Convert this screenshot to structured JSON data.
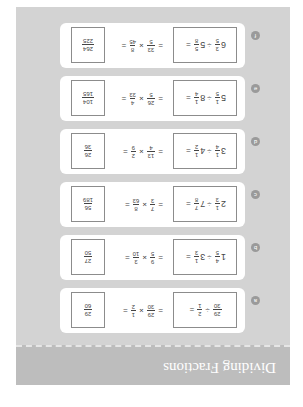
{
  "header": {
    "title": "Dividing Fractions"
  },
  "colors": {
    "panel": "#d3d3d3",
    "header": "#bdbdbd",
    "card": "#ffffff",
    "badge": "#9a9a9a"
  },
  "problems": [
    {
      "label": "a",
      "q": {
        "w1": "",
        "n1": "29",
        "d1": "30",
        "w2": "",
        "n2": "2",
        "d2": "1"
      },
      "step": {
        "n1": "29",
        "d1": "30",
        "n2": "1",
        "d2": "2"
      },
      "ans": {
        "n": "29",
        "d": "60"
      }
    },
    {
      "label": "b",
      "q": {
        "w1": "1",
        "n1": "4",
        "d1": "5",
        "w2": "3",
        "n2": "1",
        "d2": "3"
      },
      "step": {
        "n1": "9",
        "d1": "5",
        "n2": "3",
        "d2": "10"
      },
      "ans": {
        "n": "27",
        "d": "50"
      }
    },
    {
      "label": "c",
      "q": {
        "w1": "2",
        "n1": "1",
        "d1": "3",
        "w2": "7",
        "n2": "7",
        "d2": "8"
      },
      "step": {
        "n1": "7",
        "d1": "3",
        "n2": "8",
        "d2": "63"
      },
      "ans": {
        "n": "56",
        "d": "189"
      }
    },
    {
      "label": "d",
      "q": {
        "w1": "3",
        "n1": "1",
        "d1": "4",
        "w2": "4",
        "n2": "1",
        "d2": "2"
      },
      "step": {
        "n1": "13",
        "d1": "4",
        "n2": "2",
        "d2": "9"
      },
      "ans": {
        "n": "26",
        "d": "36"
      }
    },
    {
      "label": "e",
      "q": {
        "w1": "5",
        "n1": "1",
        "d1": "5",
        "w2": "8",
        "n2": "1",
        "d2": "4"
      },
      "step": {
        "n1": "26",
        "d1": "5",
        "n2": "4",
        "d2": "33"
      },
      "ans": {
        "n": "104",
        "d": "165"
      }
    },
    {
      "label": "f",
      "q": {
        "w1": "6",
        "n1": "3",
        "d1": "5",
        "w2": "5",
        "n2": "5",
        "d2": "8"
      },
      "step": {
        "n1": "33",
        "d1": "5",
        "n2": "8",
        "d2": "45"
      },
      "ans": {
        "n": "264",
        "d": "225"
      }
    }
  ],
  "symbols": {
    "divide": "÷",
    "times": "×",
    "equals": "="
  }
}
